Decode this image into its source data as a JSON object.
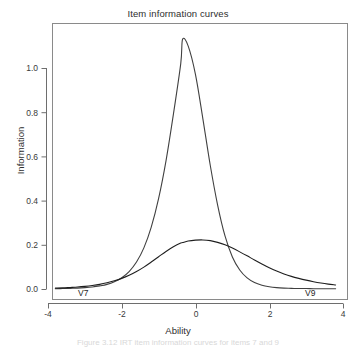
{
  "figure": {
    "title": "Item information curves",
    "caption_partial": "Figure 3.12   IRT item information curves for items 7 and 9"
  },
  "chart_data": {
    "type": "line",
    "title": "Item information curves",
    "xlabel": "Ability",
    "ylabel": "Information",
    "xlim": [
      -4,
      4
    ],
    "ylim": [
      0.0,
      1.16
    ],
    "grid": false,
    "legend": "inline-labels",
    "xticks": [
      -4,
      -2,
      0,
      2,
      4
    ],
    "xticklabels": [
      "-4",
      "-2",
      "0",
      "2",
      "4"
    ],
    "yticks": [
      0.0,
      0.2,
      0.4,
      0.6,
      0.8,
      1.0
    ],
    "yticklabels": [
      "0.0",
      "0.2",
      "0.4",
      "0.6",
      "0.8",
      "1.0"
    ],
    "x": [
      -3.8,
      -3.6,
      -3.4,
      -3.2,
      -3.0,
      -2.8,
      -2.6,
      -2.4,
      -2.2,
      -2.0,
      -1.8,
      -1.6,
      -1.4,
      -1.2,
      -1.0,
      -0.8,
      -0.6,
      -0.4,
      -0.35,
      -0.2,
      0.0,
      0.2,
      0.4,
      0.6,
      0.8,
      1.0,
      1.2,
      1.4,
      1.6,
      1.8,
      2.0,
      2.2,
      2.4,
      2.6,
      2.8,
      3.0,
      3.2,
      3.4,
      3.6,
      3.8
    ],
    "series": [
      {
        "name": "V7",
        "label": "V7",
        "color": "#404040",
        "peak_x": -0.35,
        "peak_y": 1.13,
        "values": [
          0.001,
          0.002,
          0.003,
          0.004,
          0.006,
          0.009,
          0.014,
          0.021,
          0.033,
          0.051,
          0.079,
          0.122,
          0.186,
          0.28,
          0.41,
          0.58,
          0.79,
          1.02,
          1.13,
          1.1,
          0.97,
          0.77,
          0.56,
          0.38,
          0.24,
          0.145,
          0.086,
          0.05,
          0.029,
          0.017,
          0.01,
          0.006,
          0.004,
          0.003,
          0.002,
          0.002,
          0.001,
          0.001,
          0.001,
          0.001
        ]
      },
      {
        "name": "V9",
        "label": "V9",
        "color": "#1f1f1f",
        "peak_x": 0.2,
        "peak_y": 0.22,
        "values": [
          0.004,
          0.005,
          0.007,
          0.009,
          0.012,
          0.016,
          0.021,
          0.028,
          0.037,
          0.048,
          0.062,
          0.079,
          0.099,
          0.122,
          0.146,
          0.17,
          0.191,
          0.208,
          0.21,
          0.217,
          0.221,
          0.222,
          0.219,
          0.211,
          0.2,
          0.185,
          0.168,
          0.15,
          0.131,
          0.113,
          0.096,
          0.081,
          0.068,
          0.057,
          0.048,
          0.04,
          0.033,
          0.027,
          0.022,
          0.018
        ]
      }
    ],
    "annotations": [
      {
        "text": "V7",
        "x": -3.0,
        "y": 0.015
      },
      {
        "text": "V9",
        "x": 3.15,
        "y": 0.015
      }
    ]
  }
}
